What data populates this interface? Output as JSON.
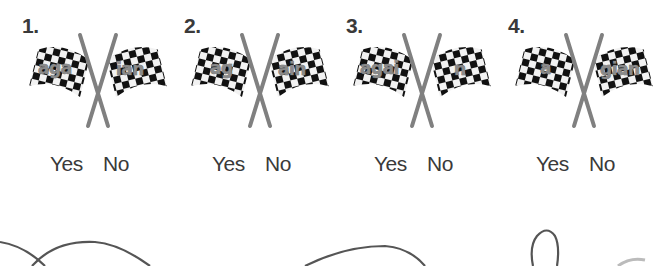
{
  "items": [
    {
      "number": "1.",
      "left_part": "aga",
      "right_part": "ian",
      "yes_label": "Yes",
      "no_label": "No"
    },
    {
      "number": "2.",
      "left_part": "ag",
      "right_part": "ain",
      "yes_label": "Yes",
      "no_label": "No"
    },
    {
      "number": "3.",
      "left_part": "agai",
      "right_part": "n",
      "yes_label": "Yes",
      "no_label": "No"
    },
    {
      "number": "4.",
      "left_part": "a",
      "right_part": "gian",
      "yes_label": "Yes",
      "no_label": "No"
    }
  ],
  "icons": {
    "flag": "crossed-checkered-flags"
  },
  "colors": {
    "text": "#3a3a3a",
    "pole": "#808080",
    "checker_dark": "#111111",
    "checker_light": "#f2f2f2",
    "word_fill": "#8a8a8a",
    "curve": "#555555"
  }
}
